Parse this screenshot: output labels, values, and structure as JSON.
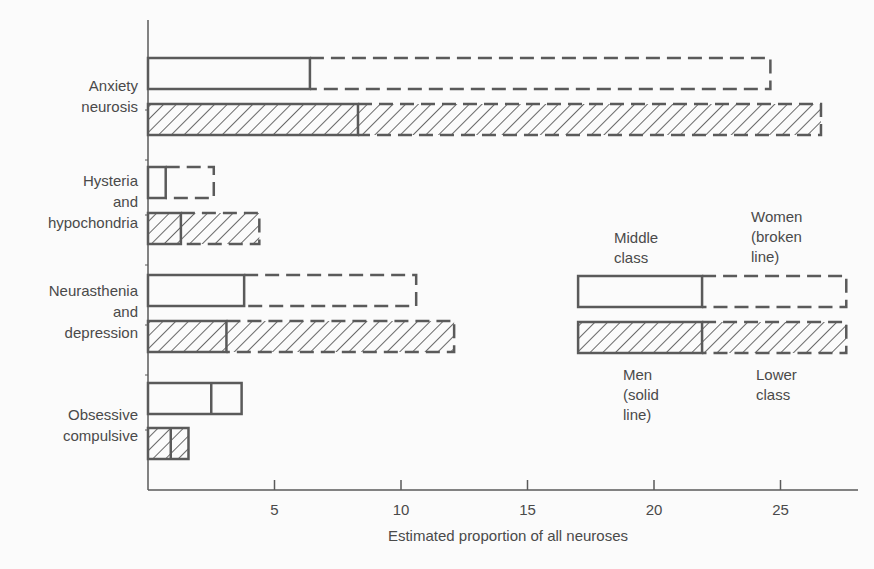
{
  "chart_data": {
    "type": "bar",
    "orientation": "horizontal",
    "title": "",
    "xlabel": "Estimated proportion of all neuroses",
    "ylabel": "",
    "xlim": [
      0,
      27.7
    ],
    "xticks": [
      5,
      10,
      15,
      20,
      25
    ],
    "grid": false,
    "categories": [
      {
        "lines": [
          "Anxiety",
          "neurosis"
        ]
      },
      {
        "lines": [
          "Hysteria",
          "and",
          "hypochondria"
        ]
      },
      {
        "lines": [
          "Neurasthenia",
          "and",
          "depression"
        ]
      },
      {
        "lines": [
          "Obsessive",
          "compulsive"
        ]
      }
    ],
    "category_names": [
      "Anxiety neurosis",
      "Hysteria and hypochondria",
      "Neurasthenia and depression",
      "Obsessive compulsive"
    ],
    "series": [
      {
        "name": "Middle class - Men",
        "class": "middle",
        "sex": "men",
        "style": "open solid",
        "values": [
          6.4,
          0.7,
          3.8,
          2.5
        ]
      },
      {
        "name": "Middle class - Women",
        "class": "middle",
        "sex": "women",
        "style": "open broken",
        "values": [
          24.6,
          2.6,
          10.6,
          3.7
        ]
      },
      {
        "name": "Lower class - Men",
        "class": "lower",
        "sex": "men",
        "style": "hatched solid",
        "values": [
          8.3,
          1.3,
          3.1,
          0.9
        ]
      },
      {
        "name": "Lower class - Women",
        "class": "lower",
        "sex": "women",
        "style": "hatched broken",
        "values": [
          26.6,
          4.4,
          12.1,
          1.6
        ]
      }
    ],
    "legend": {
      "position": "right-middle",
      "labels": {
        "middle_class": [
          "Middle",
          "class"
        ],
        "women": [
          "Women",
          "(broken",
          "line)"
        ],
        "men": [
          "Men",
          "(solid",
          "line)"
        ],
        "lower_class": [
          "Lower",
          "class"
        ]
      },
      "men_value": 21.9,
      "women_value": 27.6,
      "start_value": 17.0
    },
    "colors": {
      "ink": "#5a5a5a",
      "background": "#fbfbfb"
    }
  }
}
